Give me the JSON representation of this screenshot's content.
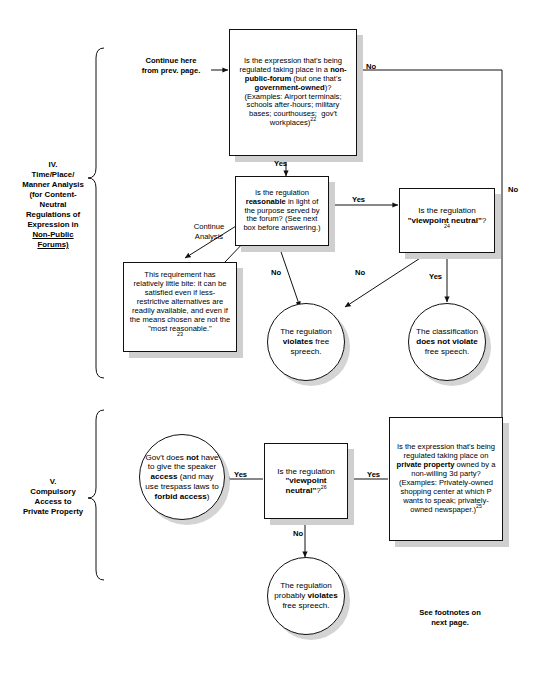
{
  "page": {
    "footer_note": "See footnotes on\nnext page."
  },
  "sections": [
    {
      "id": "section-iv",
      "label": "IV.\nTime/Place/\nManner Analysis\n(for Content-\nNeutral\nRegulations of\nExpression in\nNon-Public\nForums)",
      "label_lines": [
        "IV.",
        "Time/Place/",
        "Manner Analysis",
        "(for Content-",
        "Neutral",
        "Regulations of",
        "Expression in",
        "Non-Public",
        "Forums)"
      ]
    },
    {
      "id": "section-v",
      "label_lines": [
        "V.",
        "Compulsory",
        "Access to",
        "Private Property"
      ]
    }
  ],
  "nodes": {
    "entry_label": {
      "id": "entry-from-prev-page",
      "lines": [
        "Continue here",
        "from prev. page."
      ]
    },
    "non_public_forum": {
      "id": "non-public-forum-question",
      "text": "Is the expression that's being regulated taking place in a non-public-forum (but one that's government-owned)? (Examples: Airport terminals; schools after-hours; military bases; courthouses; gov't workplaces)",
      "footnote": "22"
    },
    "reasonable": {
      "id": "reasonable-question",
      "text": "Is the regulation reasonable in light of the purpose served by the forum? (See next box before answering.)"
    },
    "little_bite": {
      "id": "little-bite-explainer",
      "text": "This requirement has relatively little bite: it can be satisfied even if less-restrictive alternatives are readily available, and even if the means chosen are not the \"most reasonable.\"",
      "footnote": "23"
    },
    "viewpoint_neutral_iv": {
      "id": "viewpoint-neutral-question-iv",
      "text": "Is the regulation \"viewpoint neutral\"?",
      "footnote": "24"
    },
    "violates_iv": {
      "id": "violates-free-speech-outcome",
      "text": "The regulation violates free spreech."
    },
    "does_not_violate_iv": {
      "id": "does-not-violate-outcome",
      "text": "The classification does not violate free speech."
    },
    "private_property": {
      "id": "private-property-question",
      "text": "Is the expression that's being regulated taking place on private property owned by a non-willing 3d party? (Examples: Privately-owned shopping center at which P wants to speak; privately-owned newspaper.)",
      "footnote": "25"
    },
    "viewpoint_neutral_v": {
      "id": "viewpoint-neutral-question-v",
      "text": "Is the regulation \"viewpoint neutral\"?",
      "footnote": "26"
    },
    "no_access": {
      "id": "no-access-outcome",
      "text": "Gov't does not have to give the speaker access (and may use trespass laws to forbid access)"
    },
    "probably_violates": {
      "id": "probably-violates-outcome",
      "text": "The regulation probably violates free spreech."
    }
  },
  "edge_labels": {
    "npf_no": "No",
    "npf_yes": "Yes",
    "reasonable_yes": "Yes",
    "reasonable_no": "No",
    "vn_iv_no": "No",
    "vn_iv_yes": "Yes",
    "right_rail_no": "No",
    "continue_analysis": "Continue\nAnalysis",
    "pp_yes": "Yes",
    "vn_v_yes": "Yes",
    "vn_v_no": "No"
  },
  "colors": {
    "stroke": "#111111",
    "shadow": "#cfcfcf",
    "background": "#ffffff"
  }
}
